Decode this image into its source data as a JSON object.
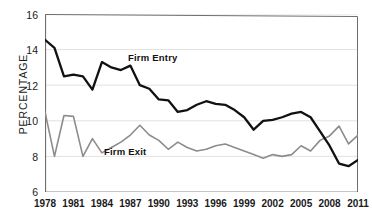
{
  "chart_data": {
    "type": "line",
    "title": "",
    "xlabel": "",
    "ylabel": "PERCENTAGE",
    "xlim": [
      1978,
      2011
    ],
    "ylim": [
      6,
      16
    ],
    "yticks": [
      6,
      8,
      10,
      12,
      14,
      16
    ],
    "xticks": [
      1978,
      1981,
      1984,
      1987,
      1990,
      1993,
      1996,
      1999,
      2002,
      2005,
      2008,
      2011
    ],
    "grid": "horizontal",
    "legend": "inline-annotations",
    "x": [
      1978,
      1979,
      1980,
      1981,
      1982,
      1983,
      1984,
      1985,
      1986,
      1987,
      1988,
      1989,
      1990,
      1991,
      1992,
      1993,
      1994,
      1995,
      1996,
      1997,
      1998,
      1999,
      2000,
      2001,
      2002,
      2003,
      2004,
      2005,
      2006,
      2007,
      2008,
      2009,
      2010,
      2011
    ],
    "series": [
      {
        "name": "Firm Entry",
        "color": "#111111",
        "values": [
          14.55,
          14.1,
          12.5,
          12.6,
          12.5,
          11.75,
          13.3,
          13.0,
          12.85,
          13.1,
          12.0,
          11.8,
          11.2,
          11.15,
          10.5,
          10.6,
          10.9,
          11.1,
          10.95,
          10.9,
          10.6,
          10.2,
          9.5,
          10.0,
          10.05,
          10.2,
          10.4,
          10.5,
          10.2,
          9.4,
          8.6,
          7.6,
          7.45,
          7.8
        ]
      },
      {
        "name": "Firm Exit",
        "color": "#8c8c8c",
        "values": [
          10.5,
          8.0,
          10.3,
          10.25,
          8.0,
          9.0,
          8.2,
          8.5,
          8.8,
          9.2,
          9.75,
          9.2,
          8.9,
          8.4,
          8.8,
          8.5,
          8.3,
          8.4,
          8.6,
          8.7,
          8.5,
          8.3,
          8.1,
          7.9,
          8.1,
          8.0,
          8.1,
          8.6,
          8.3,
          8.9,
          9.15,
          9.7,
          8.7,
          9.2
        ]
      }
    ],
    "annotations": [
      {
        "text": "Firm Entry",
        "x_px": 128,
        "y_px": 52
      },
      {
        "text": "Firm Exit",
        "x_px": 104,
        "y_px": 146
      }
    ]
  },
  "axis": {
    "ytick_labels": [
      "16",
      "14",
      "12",
      "10",
      "8",
      "6"
    ],
    "xtick_labels": [
      "1978",
      "1981",
      "1984",
      "1987",
      "1990",
      "1993",
      "1996",
      "1999",
      "2002",
      "2005",
      "2008",
      "2011"
    ]
  },
  "colors": {
    "entry": "#111111",
    "exit": "#8c8c8c",
    "grid": "#e2e2e2",
    "axis": "#666666",
    "background": "#ffffff"
  }
}
